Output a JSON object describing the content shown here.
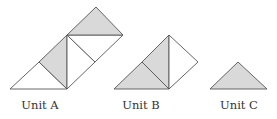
{
  "figure": {
    "colors": {
      "shade": "#d9d9d9",
      "stroke": "#555555",
      "background": "#ffffff"
    },
    "units": [
      {
        "label": "Unit A",
        "center_x": 40,
        "description": "Composite of 5 small right isosceles triangles: lower-left white, left-middle shaded, center two white, top shaded"
      },
      {
        "label": "Unit B",
        "center_x": 141,
        "description": "Composite of 3 small triangles: lower-left shaded, middle shaded, right white"
      },
      {
        "label": "Unit C",
        "center_x": 239,
        "description": "Single shaded right isosceles triangle"
      }
    ]
  }
}
